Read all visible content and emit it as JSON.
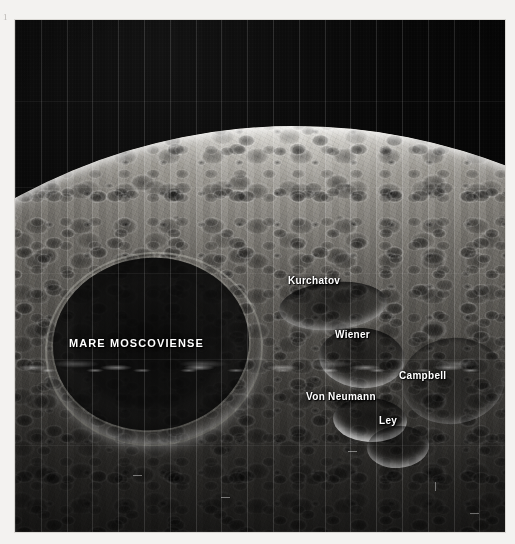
{
  "plate": {
    "number": "1"
  },
  "photo": {
    "subject": "lunar-farside-photograph",
    "scene_description": "Oblique spacecraft photograph of the lunar farside showing the limb against black space, heavily cratered highlands, and the dark basin Mare Moscoviense",
    "sky_color": "#050505",
    "surface_bright_color": "#f2f0ea",
    "surface_dark_color": "#0a0a0a",
    "label_color": "#ffffff"
  },
  "labels": [
    {
      "id": "mare-moscoviense",
      "text": "MARE MOSCOVIENSE",
      "feature_type": "mare",
      "style": "uppercase"
    },
    {
      "id": "kurchatov",
      "text": "Kurchatov",
      "feature_type": "crater",
      "style": "titlecase"
    },
    {
      "id": "wiener",
      "text": "Wiener",
      "feature_type": "crater",
      "style": "titlecase"
    },
    {
      "id": "campbell",
      "text": "Campbell",
      "feature_type": "crater",
      "style": "titlecase"
    },
    {
      "id": "von-neumann",
      "text": "Von Neumann",
      "feature_type": "crater",
      "style": "titlecase"
    },
    {
      "id": "ley",
      "text": "Ley",
      "feature_type": "crater",
      "style": "titlecase"
    }
  ]
}
